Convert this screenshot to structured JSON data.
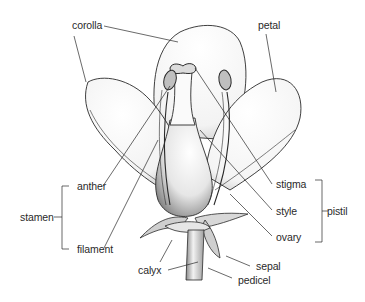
{
  "diagram": {
    "labels": {
      "corolla": "corolla",
      "petal": "petal",
      "anther": "anther",
      "stamen": "stamen",
      "filament": "filament",
      "stigma": "stigma",
      "style": "style",
      "pistil": "pistil",
      "ovary": "ovary",
      "calyx": "calyx",
      "sepal": "sepal",
      "pedicel": "pedicel"
    },
    "groups": {
      "stamen": [
        "anther",
        "filament"
      ],
      "pistil": [
        "stigma",
        "style",
        "ovary"
      ]
    },
    "colors": {
      "ink": "#2a2a2a",
      "background": "#ffffff"
    }
  }
}
